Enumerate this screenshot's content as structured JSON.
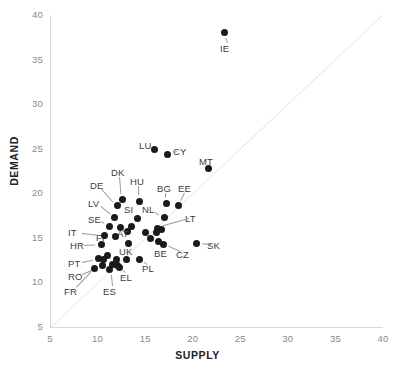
{
  "chart_data": {
    "type": "scatter",
    "title": "",
    "xlabel": "SUPPLY",
    "ylabel": "DEMAND",
    "xlim": [
      5,
      40
    ],
    "ylim": [
      5,
      40
    ],
    "xticks": [
      5,
      10,
      15,
      20,
      25,
      30,
      35,
      40
    ],
    "yticks": [
      5,
      10,
      15,
      20,
      25,
      30,
      35,
      40
    ],
    "grid": false,
    "legend": "none",
    "reference_line": {
      "type": "identity",
      "label": "y = x",
      "from": [
        5,
        5
      ],
      "to": [
        40,
        40
      ]
    },
    "marker_color": "#1a1a1a",
    "axis_color": "#d9d9d9",
    "points": [
      {
        "label": "IE",
        "x": 23.3,
        "y": 38.0,
        "lx": 220,
        "ly": 43
      },
      {
        "label": "LU",
        "x": 16.0,
        "y": 24.9,
        "lx": 139,
        "ly": 140
      },
      {
        "label": "CY",
        "x": 17.4,
        "y": 24.4,
        "lx": 173,
        "ly": 146
      },
      {
        "label": "MT",
        "x": 21.7,
        "y": 22.8,
        "lx": 199,
        "ly": 156
      },
      {
        "label": "DK",
        "x": 12.6,
        "y": 19.3,
        "lx": 111,
        "ly": 167
      },
      {
        "label": "HU",
        "x": 14.4,
        "y": 19.1,
        "lx": 130,
        "ly": 176
      },
      {
        "label": "BG",
        "x": 17.2,
        "y": 18.9,
        "lx": 157,
        "ly": 183
      },
      {
        "label": "EE",
        "x": 18.5,
        "y": 18.6,
        "lx": 178,
        "ly": 183
      },
      {
        "label": "DE",
        "x": 12.1,
        "y": 18.6,
        "lx": 90,
        "ly": 180
      },
      {
        "label": "LV",
        "x": 11.8,
        "y": 17.3,
        "lx": 88,
        "ly": 198
      },
      {
        "label": "SI",
        "x": 14.2,
        "y": 17.2,
        "lx": 124,
        "ly": 204
      },
      {
        "label": "NL",
        "x": 17.0,
        "y": 17.3,
        "lx": 142,
        "ly": 204
      },
      {
        "label": "SE",
        "x": 11.3,
        "y": 16.3,
        "lx": 88,
        "ly": 214
      },
      {
        "label": "AT",
        "x": 13.1,
        "y": 15.7,
        "lx": 117,
        "ly": 228
      },
      {
        "label": "LT",
        "x": 16.3,
        "y": 16.1,
        "lx": 185,
        "ly": 213
      },
      {
        "label": "FI",
        "x": 11.9,
        "y": 15.1,
        "lx": 96,
        "ly": 232
      },
      {
        "label": "IT",
        "x": 10.7,
        "y": 15.3,
        "lx": 68,
        "ly": 227
      },
      {
        "label": "HR",
        "x": 10.4,
        "y": 14.3,
        "lx": 70,
        "ly": 240
      },
      {
        "label": "UK",
        "x": 13.2,
        "y": 14.4,
        "lx": 119,
        "ly": 246
      },
      {
        "label": "BE",
        "x": 16.4,
        "y": 14.6,
        "lx": 154,
        "ly": 248
      },
      {
        "label": "CZ",
        "x": 16.9,
        "y": 14.3,
        "lx": 176,
        "ly": 249
      },
      {
        "label": "SK",
        "x": 20.4,
        "y": 14.4,
        "lx": 207,
        "ly": 240
      },
      {
        "label": "PT",
        "x": 10.1,
        "y": 12.7,
        "lx": 68,
        "ly": 258
      },
      {
        "label": "PL",
        "x": 14.4,
        "y": 12.6,
        "lx": 142,
        "ly": 263
      },
      {
        "label": "RO",
        "x": 10.5,
        "y": 11.9,
        "lx": 68,
        "ly": 271
      },
      {
        "label": "EL",
        "x": 12.3,
        "y": 11.7,
        "lx": 120,
        "ly": 272
      },
      {
        "label": "ES",
        "x": 11.3,
        "y": 11.5,
        "lx": 103,
        "ly": 286
      },
      {
        "label": "FR",
        "x": 9.7,
        "y": 11.6,
        "lx": 64,
        "ly": 286
      }
    ],
    "extra_markers": [
      {
        "x": 11.0,
        "y": 13.0
      },
      {
        "x": 10.6,
        "y": 12.6
      },
      {
        "x": 12.0,
        "y": 12.6
      },
      {
        "x": 11.6,
        "y": 12.0
      },
      {
        "x": 12.1,
        "y": 11.9
      },
      {
        "x": 13.0,
        "y": 12.6
      },
      {
        "x": 16.2,
        "y": 15.6
      },
      {
        "x": 16.7,
        "y": 15.9
      },
      {
        "x": 15.0,
        "y": 15.6
      },
      {
        "x": 13.6,
        "y": 16.3
      },
      {
        "x": 12.4,
        "y": 16.2
      },
      {
        "x": 15.6,
        "y": 14.9
      }
    ]
  }
}
